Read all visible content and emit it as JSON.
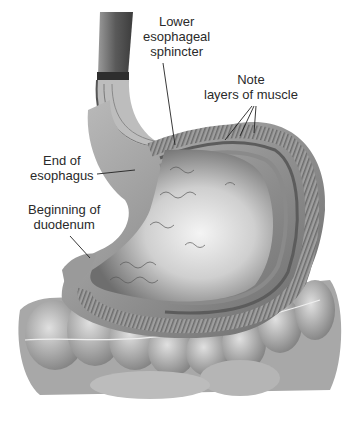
{
  "figure": {
    "style": "grayscale anatomical illustration",
    "colors": {
      "background": "#ffffff",
      "label_text": "#2a2a2a",
      "leader_line": "#222222",
      "tissue_dark": "#4a4a4a",
      "tissue_mid": "#8c8c8c",
      "tissue_light": "#d9d9d9",
      "mucosa_highlight": "#f2f2f2"
    }
  },
  "labels": {
    "lower_esophageal_sphincter": {
      "line1": "Lower",
      "line2": "esophageal",
      "line3": "sphincter"
    },
    "muscle_layers": {
      "line1": "Note",
      "line2": "layers of muscle"
    },
    "end_of_esophagus": {
      "line1": "End of",
      "line2": "esophagus"
    },
    "beginning_of_duodenum": {
      "line1": "Beginning of",
      "line2": "duodenum"
    }
  }
}
